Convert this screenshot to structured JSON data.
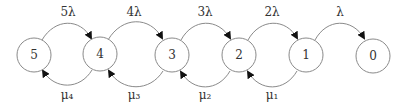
{
  "diagram": {
    "type": "state-transition (birth-death chain)",
    "nodes": [
      {
        "id": "5",
        "label": "5"
      },
      {
        "id": "4",
        "label": "4"
      },
      {
        "id": "3",
        "label": "3"
      },
      {
        "id": "2",
        "label": "2"
      },
      {
        "id": "1",
        "label": "1"
      },
      {
        "id": "0",
        "label": "0"
      }
    ],
    "forward_edges": [
      {
        "from": "5",
        "to": "4",
        "label": "5λ"
      },
      {
        "from": "4",
        "to": "3",
        "label": "4λ"
      },
      {
        "from": "3",
        "to": "2",
        "label": "3λ"
      },
      {
        "from": "2",
        "to": "1",
        "label": "2λ"
      },
      {
        "from": "1",
        "to": "0",
        "label": "λ"
      }
    ],
    "backward_edges": [
      {
        "from": "4",
        "to": "5",
        "label": "μ₄"
      },
      {
        "from": "3",
        "to": "4",
        "label": "μ₃"
      },
      {
        "from": "2",
        "to": "3",
        "label": "μ₂"
      },
      {
        "from": "1",
        "to": "2",
        "label": "μ₁"
      }
    ]
  }
}
